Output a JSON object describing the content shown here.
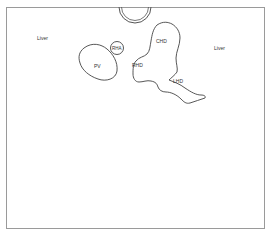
{
  "diagram": {
    "type": "anatomical-schematic",
    "frame_color": "#9a9a9a",
    "stroke_color": "#444444",
    "labels": {
      "liver_left": "Liver",
      "liver_right": "Liver",
      "pv": "PV",
      "rha": "RHA",
      "chd": "CHD",
      "rhd": "RHD",
      "lhd": "LHD"
    },
    "structures": [
      {
        "id": "pv",
        "name": "Portal vein",
        "label": "PV"
      },
      {
        "id": "rha",
        "name": "Right hepatic artery",
        "label": "RHA"
      },
      {
        "id": "chd",
        "name": "Common hepatic duct",
        "label": "CHD"
      },
      {
        "id": "rhd",
        "name": "Right hepatic duct",
        "label": "RHD"
      },
      {
        "id": "lhd",
        "name": "Left hepatic duct",
        "label": "LHD"
      }
    ]
  }
}
